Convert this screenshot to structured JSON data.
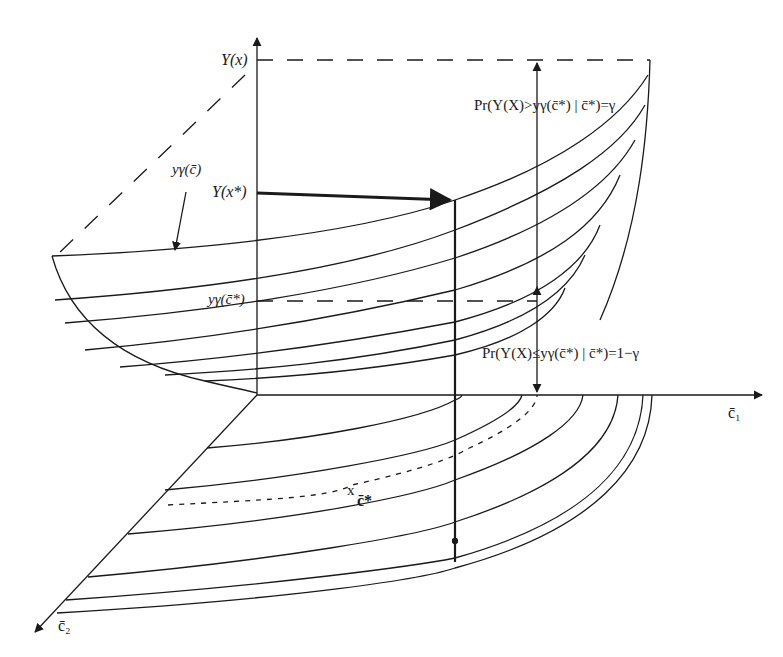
{
  "diagram": {
    "title": "",
    "axes": {
      "vertical": {
        "label": "Y(x)"
      },
      "horizontal_right": {
        "label": "c̄₁"
      },
      "diagonal_left": {
        "label": "c̄₂"
      }
    },
    "labels": {
      "y_x_star": "Y(x*)",
      "y_gamma_c": "yγ(c̄)",
      "y_gamma_c_star": "yγ(c̄*)",
      "pr_upper": "Pr(Y(X)>yγ(c̄*) | c̄*)=γ",
      "pr_lower": "Pr(Y(X)≤yγ(c̄*) | c̄*)=1−γ",
      "c_star_point": "c̄*",
      "c_star_marker": "x"
    },
    "colors": {
      "ink": "#1a1a1a",
      "background": "#ffffff"
    }
  }
}
